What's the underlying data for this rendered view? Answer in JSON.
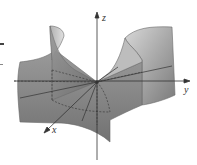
{
  "figure": {
    "type": "3d-surface-diagram",
    "surface": "saddle (hyperbolic paraboloid)",
    "axes": {
      "x_label": "x",
      "y_label": "y",
      "z_label": "z"
    },
    "colors": {
      "surface_fill": "#8a8a8a",
      "surface_light": "#c8c8c8",
      "surface_edge": "#6a6a6a",
      "axis": "#333333",
      "background": "#ffffff"
    }
  }
}
